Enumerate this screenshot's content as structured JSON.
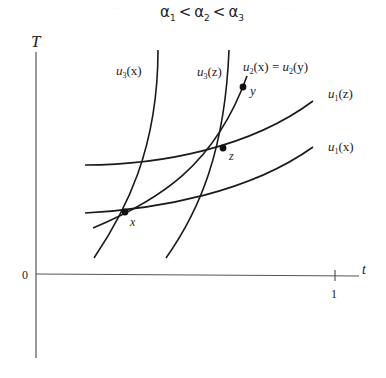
{
  "title": {
    "alpha": "α",
    "subs": [
      "1",
      "2",
      "3"
    ],
    "op": "<"
  },
  "faint_marks": [
    "· · · ·",
    "· · · ·"
  ],
  "axes": {
    "y_label": "T",
    "x_label": "t",
    "origin_label": "0",
    "x_tick_label": "1"
  },
  "points": {
    "x": "x",
    "y": "y",
    "z": "z"
  },
  "curve_labels": {
    "u3x": {
      "u": "u",
      "sub": "3",
      "arg": "(x)"
    },
    "u3z": {
      "u": "u",
      "sub": "3",
      "arg": "(z)"
    },
    "u2": {
      "u": "u",
      "sub": "2",
      "arg": "(x)",
      "eq": " = ",
      "u_b": "u",
      "sub_b": "2",
      "arg_b": "(y)"
    },
    "u1z": {
      "u": "u",
      "sub": "1",
      "arg": "(z)"
    },
    "u1x": {
      "u": "u",
      "sub": "1",
      "arg": "(x)"
    }
  },
  "colors": {
    "ink": "#1a1a1a",
    "axis": "#555555",
    "background": "#ffffff"
  }
}
